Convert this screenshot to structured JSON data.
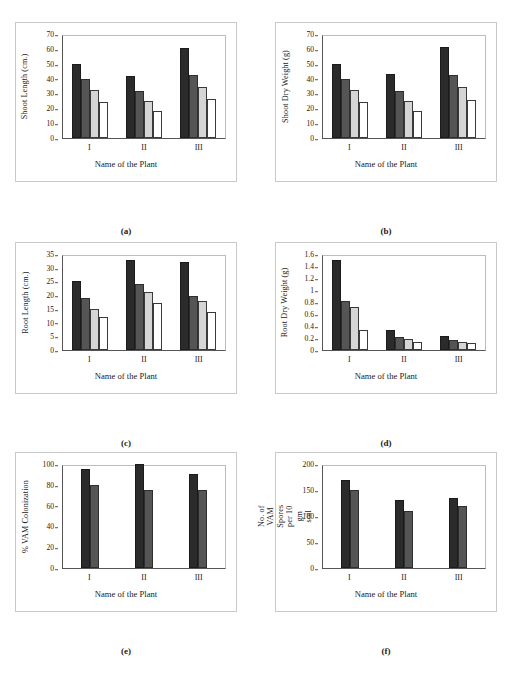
{
  "figure": {
    "xlabel_common": "Name of the Plant",
    "group_labels": [
      "I",
      "II",
      "III"
    ],
    "series_colors": [
      "#2b2b2b",
      "#555555",
      "#d5d5d5",
      "#ffffff"
    ]
  },
  "captions": {
    "a": "(a)",
    "b": "(b)",
    "c": "(c)",
    "d": "(d)",
    "e": "(e)",
    "f": "(f)"
  },
  "chart_data": [
    {
      "type": "bar",
      "panel": "a",
      "title": "",
      "ylabel": "Shoot Length (cm.)",
      "xlabel": "Name of the Plant",
      "categories": [
        "I",
        "II",
        "III"
      ],
      "yticks": [
        0,
        10,
        20,
        30,
        40,
        50,
        60,
        70
      ],
      "ylim": [
        0,
        70
      ],
      "grid": false,
      "legend": "none",
      "series": [
        {
          "name": "series-1",
          "values": [
            50,
            42,
            60.5
          ]
        },
        {
          "name": "series-2",
          "values": [
            39.5,
            31.5,
            42.5
          ]
        },
        {
          "name": "series-3",
          "values": [
            32.5,
            25,
            34.5
          ]
        },
        {
          "name": "series-4",
          "values": [
            24.5,
            18.5,
            26
          ]
        }
      ]
    },
    {
      "type": "bar",
      "panel": "b",
      "title": "",
      "ylabel": "Shoot Dry Weight (g)",
      "xlabel": "Name of the Plant",
      "categories": [
        "I",
        "II",
        "III"
      ],
      "yticks": [
        0,
        10,
        20,
        30,
        40,
        50,
        60,
        70
      ],
      "ylim": [
        0,
        70
      ],
      "grid": false,
      "legend": "none",
      "series": [
        {
          "name": "series-1",
          "values": [
            50,
            43,
            61
          ]
        },
        {
          "name": "series-2",
          "values": [
            39.5,
            31.5,
            42.5
          ]
        },
        {
          "name": "series-3",
          "values": [
            32.5,
            25,
            34.5
          ]
        },
        {
          "name": "series-4",
          "values": [
            24.5,
            18.5,
            25.5
          ]
        }
      ]
    },
    {
      "type": "bar",
      "panel": "c",
      "title": "",
      "ylabel": "Root Length (cm.)",
      "xlabel": "Name of the Plant",
      "categories": [
        "I",
        "II",
        "III"
      ],
      "yticks": [
        0,
        5,
        10,
        15,
        20,
        25,
        30,
        35
      ],
      "ylim": [
        0,
        35
      ],
      "grid": false,
      "legend": "none",
      "series": [
        {
          "name": "series-1",
          "values": [
            25,
            33,
            32
          ]
        },
        {
          "name": "series-2",
          "values": [
            19,
            24,
            19.7
          ]
        },
        {
          "name": "series-3",
          "values": [
            15,
            21,
            17.7
          ]
        },
        {
          "name": "series-4",
          "values": [
            12,
            17,
            14
          ]
        }
      ]
    },
    {
      "type": "bar",
      "panel": "d",
      "title": "",
      "ylabel": "Root Dry Weight (g)",
      "xlabel": "Name of the Plant",
      "categories": [
        "I",
        "II",
        "III"
      ],
      "yticks": [
        0,
        0.2,
        0.4,
        0.6,
        0.8,
        1,
        1.2,
        1.4,
        1.6
      ],
      "ytick_labels": [
        "0",
        "0.2",
        "0.4",
        "0.6",
        "0.8",
        "1",
        "1.2",
        "1.4",
        "1.6"
      ],
      "ylim": [
        0,
        1.6
      ],
      "grid": false,
      "legend": "none",
      "series": [
        {
          "name": "series-1",
          "values": [
            1.5,
            0.34,
            0.23
          ]
        },
        {
          "name": "series-2",
          "values": [
            0.81,
            0.22,
            0.175
          ]
        },
        {
          "name": "series-3",
          "values": [
            0.71,
            0.185,
            0.14
          ]
        },
        {
          "name": "series-4",
          "values": [
            0.34,
            0.13,
            0.11
          ]
        }
      ]
    },
    {
      "type": "bar",
      "panel": "e",
      "title": "",
      "ylabel": "% VAM Colonization",
      "xlabel": "Name of the Plant",
      "categories": [
        "I",
        "II",
        "III"
      ],
      "yticks": [
        0,
        20,
        40,
        60,
        80,
        100
      ],
      "ylim": [
        0,
        100
      ],
      "grid": false,
      "legend": "none",
      "series": [
        {
          "name": "series-1",
          "values": [
            95,
            100,
            90
          ]
        },
        {
          "name": "series-2",
          "values": [
            80,
            75,
            75
          ]
        }
      ]
    },
    {
      "type": "bar",
      "panel": "f",
      "title": "",
      "ylabel": "No. of VAM Spores per 10 gm soil",
      "xlabel": "Name of the Plant",
      "categories": [
        "I",
        "II",
        "III"
      ],
      "yticks": [
        0,
        50,
        100,
        150,
        200
      ],
      "ylim": [
        0,
        200
      ],
      "grid": false,
      "legend": "none",
      "series": [
        {
          "name": "series-1",
          "values": [
            170,
            130,
            135
          ]
        },
        {
          "name": "series-2",
          "values": [
            150,
            110,
            120
          ]
        }
      ]
    }
  ]
}
